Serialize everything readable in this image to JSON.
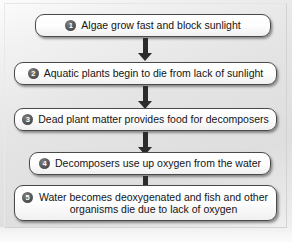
{
  "figure": {
    "background_color": "#e4e4e4",
    "box_fill_color": "#ffffff",
    "box_border_color": "#4a4a4a",
    "badge_color": "#4a4a4a",
    "badge_text_color": "#ffffff",
    "arrow_color": "#2b2b2b",
    "text_color": "#141414"
  },
  "flow": {
    "type": "flowchart",
    "direction": "vertical",
    "steps": [
      {
        "number": "1",
        "badge": "❶",
        "text": "Algae grow fast and block sunlight",
        "lines": [
          "Algae grow fast and block sunlight"
        ]
      },
      {
        "number": "2",
        "badge": "❷",
        "text": "Aquatic plants begin to die from lack of sunlight",
        "lines": [
          "Aquatic plants begin to die from lack of sunlight"
        ]
      },
      {
        "number": "3",
        "badge": "❸",
        "text": "Dead plant matter provides food for decomposers",
        "lines": [
          "Dead plant matter provides food for decomposers"
        ]
      },
      {
        "number": "4",
        "badge": "❹",
        "text": "Decomposers use up oxygen from the water",
        "lines": [
          "Decomposers use up oxygen from the water"
        ]
      },
      {
        "number": "5",
        "badge": "❺",
        "text": "Water becomes deoxygenated and fish and other organisms die due to lack of oxygen",
        "lines": [
          "Water becomes deoxygenated and fish and other",
          "organisms die due to lack of oxygen"
        ]
      }
    ],
    "connectors": [
      {
        "from": "1",
        "to": "2",
        "shape": "down-arrow"
      },
      {
        "from": "2",
        "to": "3",
        "shape": "down-arrow"
      },
      {
        "from": "3",
        "to": "4",
        "shape": "down-arrow"
      },
      {
        "from": "4",
        "to": "5",
        "shape": "down-arrow"
      }
    ]
  }
}
